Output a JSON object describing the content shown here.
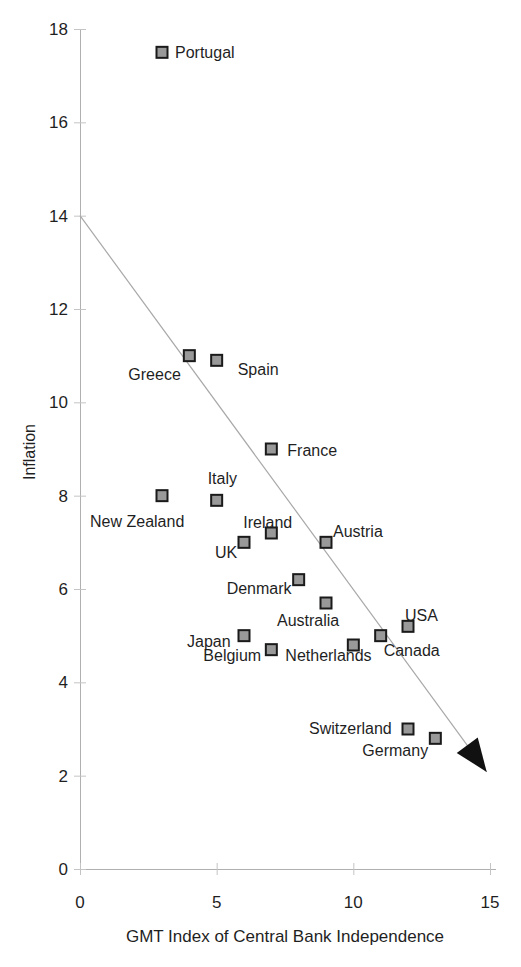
{
  "chart_data": {
    "type": "scatter",
    "title": "",
    "xlabel": "GMT Index of Central Bank Independence",
    "ylabel": "Inflation",
    "xlim": [
      0,
      15
    ],
    "ylim": [
      0,
      18
    ],
    "xticks": [
      0,
      5,
      10,
      15
    ],
    "yticks": [
      0,
      2,
      4,
      6,
      8,
      10,
      12,
      14,
      16,
      18
    ],
    "grid": false,
    "legend": "none",
    "marker_shape": "square",
    "points": [
      {
        "label": "Portugal",
        "x": 3,
        "y": 17.5,
        "dx": 13,
        "dy": 6
      },
      {
        "label": "Greece",
        "x": 4,
        "y": 11.0,
        "dx": -61,
        "dy": 24
      },
      {
        "label": "Spain",
        "x": 5,
        "y": 10.9,
        "dx": 21,
        "dy": 15
      },
      {
        "label": "France",
        "x": 7,
        "y": 9.0,
        "dx": 16,
        "dy": 7
      },
      {
        "label": "New Zealand",
        "x": 3,
        "y": 8.0,
        "dx": -72,
        "dy": 31
      },
      {
        "label": "Italy",
        "x": 5,
        "y": 7.9,
        "dx": -9,
        "dy": -16
      },
      {
        "label": "Ireland",
        "x": 7,
        "y": 7.2,
        "dx": -28,
        "dy": -5
      },
      {
        "label": "UK",
        "x": 6,
        "y": 7.0,
        "dx": -29,
        "dy": 16
      },
      {
        "label": "Austria",
        "x": 9,
        "y": 7.0,
        "dx": 7,
        "dy": -5
      },
      {
        "label": "Denmark",
        "x": 8,
        "y": 6.2,
        "dx": -72,
        "dy": 14
      },
      {
        "label": "Australia",
        "x": 9,
        "y": 5.7,
        "dx": -49,
        "dy": 23
      },
      {
        "label": "Japan",
        "x": 6,
        "y": 5.0,
        "dx": -57,
        "dy": 11
      },
      {
        "label": "Belgium",
        "x": 7,
        "y": 4.7,
        "dx": -68,
        "dy": 11
      },
      {
        "label": "Netherlands",
        "x": 10,
        "y": 4.8,
        "dx": -68,
        "dy": 16
      },
      {
        "label": "Canada",
        "x": 11,
        "y": 5.0,
        "dx": 3,
        "dy": 20
      },
      {
        "label": "USA",
        "x": 12,
        "y": 5.2,
        "dx": -3,
        "dy": -5
      },
      {
        "label": "Switzerland",
        "x": 12,
        "y": 3.0,
        "dx": -99,
        "dy": 5
      },
      {
        "label": "Germany",
        "x": 13,
        "y": 2.8,
        "dx": -73,
        "dy": 18
      }
    ],
    "trend_line": {
      "x1": 0,
      "y1": 14.0,
      "x2": 14.88,
      "y2": 2.08,
      "arrow_end": true
    },
    "colors": {
      "background": "#ffffff",
      "axis": "#b0b0b0",
      "tick": "#c4c4c4",
      "text": "#1f1f1f",
      "marker_fill": "#999999",
      "marker_border": "#1a1a1a",
      "trend_line": "#a8a8a8",
      "arrowhead": "#111111"
    }
  }
}
